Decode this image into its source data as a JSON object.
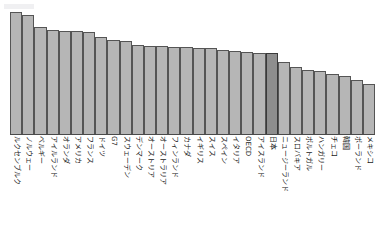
{
  "header": {
    "clipped_text": ""
  },
  "chart_data": {
    "type": "bar",
    "title": "",
    "subtitle": "",
    "xlabel": "",
    "ylabel": "",
    "grid": false,
    "legend": "none",
    "ylim": [
      0,
      100
    ],
    "highlight_category": "日本",
    "colors": {
      "bar_fill": "#b6b6b6",
      "bar_stroke": "#555555",
      "highlight_fill": "#8e8e8e",
      "highlight_stroke": "#3a3a3a",
      "background": "#ffffff",
      "axis": "#4a4a4a"
    },
    "categories": [
      "ルクセンブルク",
      "ノルウェー",
      "ベルギー",
      "アイルランド",
      "オランダ",
      "アメリカ",
      "フランス",
      "ドイツ",
      "G7",
      "スウェーデン",
      "デンマーク",
      "オーストリア",
      "オーストラリア",
      "フィンランド",
      "カナダ",
      "イギリス",
      "スイス",
      "スペイン",
      "イタリア",
      "OECD",
      "アイスランド",
      "日本",
      "ニュージーランド",
      "スロバキア",
      "ポルトガル",
      "ハンガリー",
      "チェコ",
      "韓国",
      "ポーランド",
      "メキシコ"
    ],
    "values": [
      98,
      96,
      86,
      84,
      83,
      83,
      82,
      78,
      76,
      75,
      72,
      71,
      71,
      70,
      70,
      69,
      69,
      68,
      67,
      66,
      65,
      65,
      58,
      54,
      52,
      51,
      49,
      47,
      44,
      41
    ]
  }
}
